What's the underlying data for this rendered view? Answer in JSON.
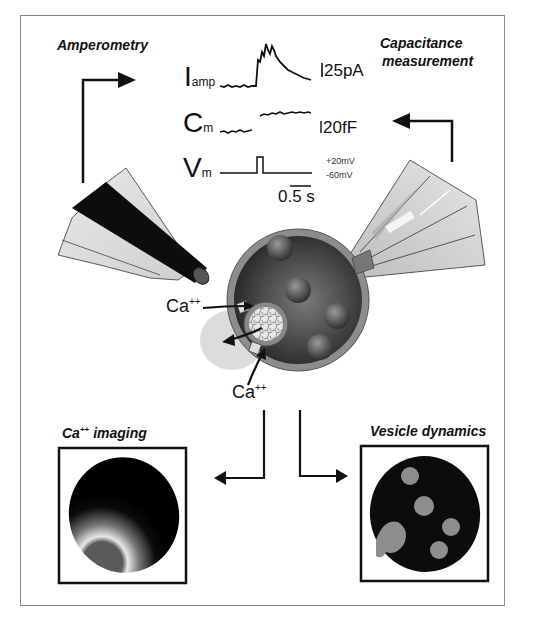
{
  "titles": {
    "amperometry": "Amperometry",
    "capacitance_line1": "Capacitance",
    "capacitance_line2": "measurement",
    "ca_imaging_prefix": "Ca",
    "ca_imaging_sup": "++",
    "ca_imaging_suffix": " imaging",
    "vesicle_dynamics": "Vesicle dynamics"
  },
  "traces": {
    "iamp": {
      "main": "I",
      "sub": "amp",
      "scale": "25pA"
    },
    "cm": {
      "main": "C",
      "sub": "m",
      "scale": "20fF"
    },
    "vm": {
      "main": "V",
      "sub": "m",
      "high": "+20mV",
      "low": "-60mV"
    },
    "time_scale": "0.5 s"
  },
  "ions": {
    "upper": {
      "label": "Ca",
      "sup": "++"
    },
    "lower": {
      "label": "Ca",
      "sup": "++"
    }
  },
  "colors": {
    "ink": "#111111",
    "frame": "#8a8a8a",
    "cell_dark": "#2e2e2e",
    "cell_mid": "#6a6a6a",
    "membrane": "#8c8c8c",
    "vesicle": "#5a5a5a",
    "pipette_light": "#d8d8d8",
    "electrode": "#111111",
    "release_cloud": "#d9d9d9",
    "image_bg": "#0a0a0a",
    "image_vesicle": "#8e8e8e"
  }
}
